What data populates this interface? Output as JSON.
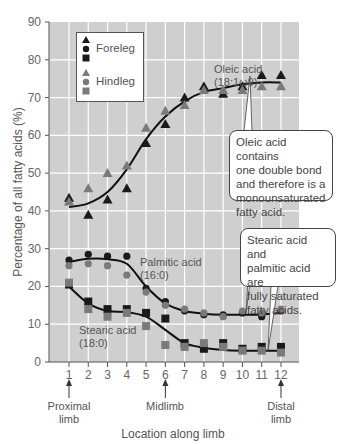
{
  "chart_data": {
    "type": "scatter",
    "title": "",
    "xlabel": "Location along limb",
    "ylabel": "Percentage of all fatty acids (%)",
    "xlim": [
      0.3,
      12.9
    ],
    "ylim": [
      0,
      90
    ],
    "x": [
      1,
      2,
      3,
      4,
      5,
      6,
      7,
      8,
      9,
      10,
      11,
      12
    ],
    "x_ticks": [
      "1",
      "2",
      "3",
      "4",
      "5",
      "6",
      "7",
      "8",
      "9",
      "10",
      "11",
      "12"
    ],
    "y_ticks": [
      0,
      10,
      20,
      30,
      40,
      50,
      60,
      70,
      80,
      90
    ],
    "grid": true,
    "legend_position": "upper-left",
    "series": [
      {
        "name": "Foreleg oleic acid",
        "group": "Foreleg",
        "marker": "triangle",
        "color": "#1a1a1a",
        "values": [
          43.5,
          39,
          43,
          46,
          58,
          63,
          70,
          73,
          71,
          73,
          76,
          76
        ]
      },
      {
        "name": "Hindleg oleic acid",
        "group": "Hindleg",
        "marker": "triangle",
        "color": "#7a7a7a",
        "values": [
          42.5,
          46,
          50,
          52,
          62,
          66.5,
          68,
          72,
          72,
          72,
          73,
          73
        ]
      },
      {
        "name": "Foreleg palmitic acid",
        "group": "Foreleg",
        "marker": "circle",
        "color": "#1a1a1a",
        "values": [
          27,
          28.5,
          28,
          28,
          19.5,
          16,
          13.5,
          12.5,
          12.5,
          13,
          12,
          13.5
        ]
      },
      {
        "name": "Hindleg palmitic acid",
        "group": "Hindleg",
        "marker": "circle",
        "color": "#7a7a7a",
        "values": [
          25.5,
          26,
          25.5,
          23,
          18.5,
          15,
          14,
          13,
          12,
          13.5,
          13,
          14
        ]
      },
      {
        "name": "Foreleg stearic acid",
        "group": "Foreleg",
        "marker": "square",
        "color": "#1a1a1a",
        "values": [
          20.5,
          16,
          14,
          14,
          13,
          11.5,
          5,
          3.5,
          5,
          3.5,
          4,
          4
        ]
      },
      {
        "name": "Hindleg stearic acid",
        "group": "Hindleg",
        "marker": "square",
        "color": "#7a7a7a",
        "values": [
          21,
          14,
          12,
          13,
          9.5,
          4.5,
          4,
          5,
          4,
          3,
          3,
          2.5
        ]
      }
    ],
    "fit_curves": [
      {
        "name": "Oleic acid fit",
        "values": [
          41,
          42,
          45,
          51,
          59,
          65,
          69,
          71.5,
          72.5,
          73.5,
          74,
          74
        ]
      },
      {
        "name": "Palmitic acid fit",
        "values": [
          26.5,
          27.3,
          27.2,
          26,
          20,
          15.5,
          13.5,
          12.8,
          12.5,
          12.5,
          12.6,
          13
        ]
      },
      {
        "name": "Stearic acid fit",
        "values": [
          20,
          15.5,
          13.5,
          13.2,
          12,
          8.5,
          5,
          3.8,
          3.2,
          3,
          3,
          3
        ]
      }
    ],
    "legend": [
      "Foreleg",
      "Hindleg"
    ],
    "annotations": [
      {
        "text": "Oleic acid\n(18:1ω9)",
        "x": 7.6,
        "y": 78
      },
      {
        "text": "Palmitic acid\n(16:0)",
        "x": 5.1,
        "y": 23.5
      },
      {
        "text": "Stearic acid\n(18:0)",
        "x": 2.1,
        "y": 8.5
      },
      {
        "text": "Proximal\nlimb",
        "x": 1
      },
      {
        "text": "Midlimb",
        "x": 6
      },
      {
        "text": "Distal\nlimb",
        "x": 12
      }
    ]
  },
  "legend": {
    "foreleg_label": "Foreleg",
    "hindleg_label": "Hindleg"
  },
  "labels": {
    "oleic_line1": "Oleic acid",
    "oleic_line2": "(18:1ω9)",
    "palmitic_line1": "Palmitic acid",
    "palmitic_line2": "(16:0)",
    "stearic_line1": "Stearic acid",
    "stearic_line2": "(18:0)",
    "proximal_line1": "Proximal",
    "proximal_line2": "limb",
    "midlimb": "Midlimb",
    "distal_line1": "Distal",
    "distal_line2": "limb",
    "xlabel": "Location along limb",
    "ylabel": "Percentage of all fatty acids (%)"
  },
  "callouts": {
    "oleic_note": "Oleic acid contains\none double bond\nand therefore is a\nmonounsaturated\nfatty acid.",
    "saturated_note": "Stearic acid and\npalmitic acid are\nfully saturated\nfatty acids."
  }
}
